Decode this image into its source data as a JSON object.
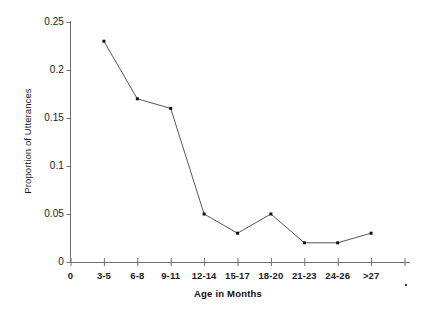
{
  "chart_data": {
    "type": "line",
    "title": "",
    "xlabel": "Age in Months",
    "ylabel": "Proportion of Utterances",
    "categories": [
      "3-5",
      "6-8",
      "9-11",
      "12-14",
      "15-17",
      "18-20",
      "21-23",
      "24-26",
      ">27"
    ],
    "values": [
      0.23,
      0.17,
      0.16,
      0.05,
      0.03,
      0.05,
      0.02,
      0.02,
      0.03
    ],
    "series": [
      {
        "name": "Proportion of Utterances",
        "values": [
          0.23,
          0.17,
          0.16,
          0.05,
          0.03,
          0.05,
          0.02,
          0.02,
          0.03
        ]
      }
    ],
    "x_tick_labels": [
      "0",
      "3-5",
      "6-8",
      "9-11",
      "12-14",
      "15-17",
      "18-20",
      "21-23",
      "24-26",
      ">27"
    ],
    "y_tick_labels": [
      "0",
      "0.05",
      "0.1",
      "0.15",
      "0.2",
      "0.25"
    ],
    "y_tick_values": [
      0,
      0.05,
      0.1,
      0.15,
      0.2,
      0.25
    ],
    "ylim": [
      0,
      0.25
    ],
    "grid": false,
    "legend": "none",
    "marker": "square",
    "line_color": "#444444",
    "marker_color": "#111111",
    "axis_color": "#6e6e6e"
  },
  "axes": {
    "y_title": "Proportion of Utterances",
    "x_title": "Age in Months"
  }
}
